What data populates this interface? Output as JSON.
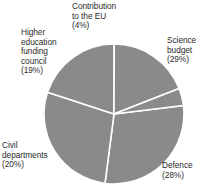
{
  "chart_data": {
    "type": "pie",
    "title": "",
    "subtitle": "",
    "xlabel": "",
    "ylabel": "",
    "legend_position": "none",
    "grid": false,
    "slice_fill_color": "#8a8a8a",
    "slice_edge_color": "#ffffff",
    "label_color": "#2b2b2b",
    "background_color": "#ffffff",
    "categories": [
      "Science budget",
      "Defence",
      "Civil departments",
      "Higher education funding council",
      "Contribution to the EU"
    ],
    "values": [
      29,
      28,
      20,
      19,
      4
    ],
    "value_unit": "%",
    "start_angle_deg": -7,
    "direction": "clockwise",
    "slices": [
      {
        "name": "Science budget",
        "value": 29,
        "label_text": "Science\nbudget\n(29%)",
        "label_position": "right"
      },
      {
        "name": "Defence",
        "value": 28,
        "label_text": "Defence\n(28%)",
        "label_position": "bottom-right"
      },
      {
        "name": "Civil departments",
        "value": 20,
        "label_text": "Civil\ndepartments\n(20%)",
        "label_position": "bottom-left"
      },
      {
        "name": "Higher education funding council",
        "value": 19,
        "label_text": "Higher\neducation\nfunding\ncouncil\n(19%)",
        "label_position": "left"
      },
      {
        "name": "Contribution to the EU",
        "value": 4,
        "label_text": "Contribution\nto the EU\n(4%)",
        "label_position": "top"
      }
    ]
  },
  "labels": {
    "eu": "Contribution\nto the EU\n(4%)",
    "hefc": "Higher\neducation\nfunding\ncouncil\n(19%)",
    "science": "Science\nbudget\n(29%)",
    "defence": "Defence\n(28%)",
    "civil": "Civil\ndepartments\n(20%)"
  }
}
